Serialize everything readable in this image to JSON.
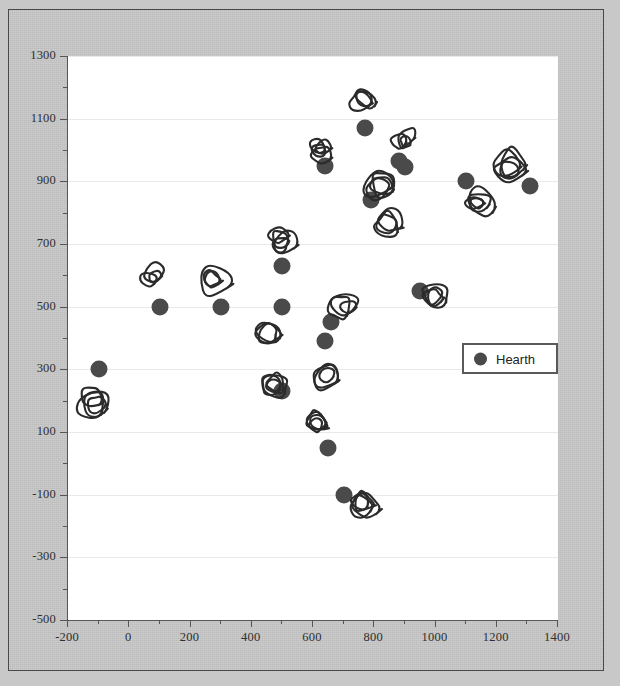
{
  "figure": {
    "background_color": "#c6c6c6",
    "plot_background_color": "#ffffff",
    "border_color": "#4a4a4a"
  },
  "legend": {
    "position": "center-right",
    "entries": [
      {
        "label": "Hearth",
        "marker": "filled-circle",
        "color": "#4a4a4a"
      }
    ]
  },
  "chart_data": {
    "type": "scatter",
    "title": "",
    "xlabel": "",
    "ylabel": "",
    "xlim": [
      -200,
      1400
    ],
    "ylim": [
      -500,
      1300
    ],
    "xticks": [
      -200,
      0,
      200,
      400,
      600,
      800,
      1000,
      1200,
      1400
    ],
    "yticks": [
      1300,
      1100,
      900,
      700,
      500,
      300,
      100,
      -100,
      -300,
      -500
    ],
    "xtick_labels": [
      "-200",
      "0",
      "200",
      "400",
      "600",
      "800",
      "1000",
      "1200",
      "1400"
    ],
    "ytick_labels": [
      "1300",
      "1100",
      "900",
      "700",
      "500",
      "300",
      "100",
      "-100",
      "-300",
      "-500"
    ],
    "grid": true,
    "grid_axis": "y",
    "grid_color": "#e9e9e9",
    "minor_ticks": true,
    "legend_position": "center-right",
    "series": [
      {
        "name": "Hearth",
        "marker": "filled-circle",
        "color": "#4a4a4a",
        "points": [
          {
            "x": -100,
            "y": 300
          },
          {
            "x": 100,
            "y": 500
          },
          {
            "x": 300,
            "y": 500
          },
          {
            "x": 500,
            "y": 500
          },
          {
            "x": 500,
            "y": 630
          },
          {
            "x": 500,
            "y": 230
          },
          {
            "x": 640,
            "y": 390
          },
          {
            "x": 660,
            "y": 450
          },
          {
            "x": 650,
            "y": 50
          },
          {
            "x": 700,
            "y": -100
          },
          {
            "x": 640,
            "y": 950
          },
          {
            "x": 770,
            "y": 1070
          },
          {
            "x": 790,
            "y": 840
          },
          {
            "x": 880,
            "y": 965
          },
          {
            "x": 900,
            "y": 945
          },
          {
            "x": 950,
            "y": 550
          },
          {
            "x": 1100,
            "y": 900
          },
          {
            "x": 1310,
            "y": 885
          }
        ]
      }
    ],
    "annotation_glyphs": {
      "description": "hand-drawn scribbled loop outlines paired with most data points",
      "color": "#2b2b2b",
      "positions": [
        {
          "x": -125,
          "y": 200
        },
        {
          "x": 75,
          "y": 590
        },
        {
          "x": 280,
          "y": 585
        },
        {
          "x": 455,
          "y": 420
        },
        {
          "x": 470,
          "y": 255
        },
        {
          "x": 505,
          "y": 715
        },
        {
          "x": 620,
          "y": 120
        },
        {
          "x": 640,
          "y": 275
        },
        {
          "x": 700,
          "y": 500
        },
        {
          "x": 760,
          "y": 1160
        },
        {
          "x": 770,
          "y": -125
        },
        {
          "x": 620,
          "y": 1000
        },
        {
          "x": 830,
          "y": 880
        },
        {
          "x": 845,
          "y": 760
        },
        {
          "x": 890,
          "y": 1025
        },
        {
          "x": 1000,
          "y": 545
        },
        {
          "x": 1140,
          "y": 845
        },
        {
          "x": 1240,
          "y": 950
        }
      ]
    }
  }
}
